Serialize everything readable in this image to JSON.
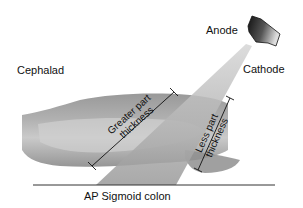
{
  "diagram": {
    "title": "AP Sigmoid colon",
    "labels": {
      "anode": "Anode",
      "cathode": "Cathode",
      "cephalad": "Cephalad",
      "greater_line1": "Greater part",
      "greater_line2": "thickness",
      "less_line1": "Less part",
      "less_line2": "thickness",
      "caption": "AP Sigmoid colon"
    },
    "colors": {
      "background": "#ffffff",
      "colon_fill": "#9a9a9a",
      "beam_fill": "#b8b8b8",
      "text": "#111111",
      "tube_dark": "#1a1a1a",
      "tube_light": "#e0e0e0"
    }
  }
}
